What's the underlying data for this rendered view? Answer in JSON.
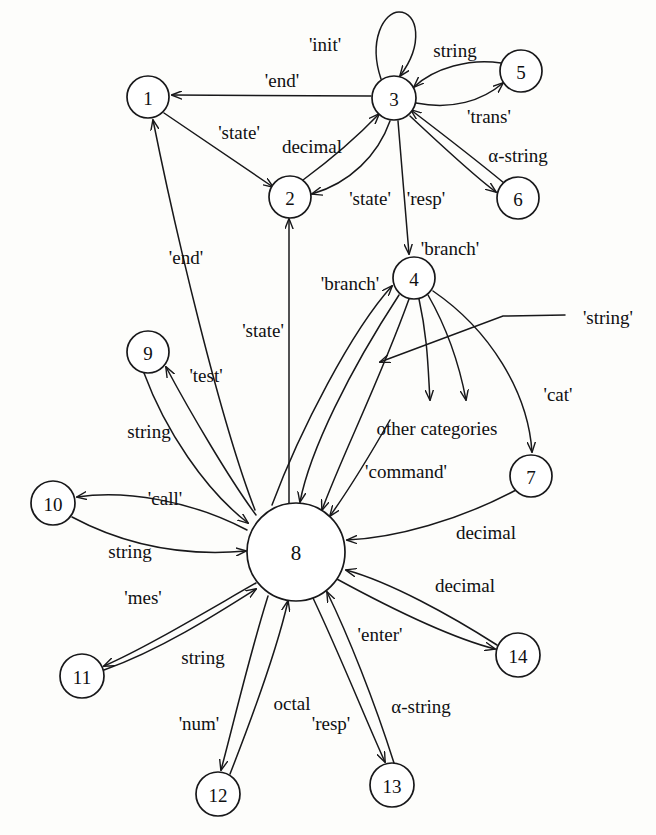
{
  "figure": {
    "type": "state-transition-diagram",
    "caption": "",
    "background_color": "#fdfdfb",
    "ink_color": "#18181a"
  },
  "nodes": [
    {
      "id": "1",
      "label": "1",
      "cx": 148,
      "cy": 97,
      "r": 21
    },
    {
      "id": "2",
      "label": "2",
      "cx": 290,
      "cy": 197,
      "r": 21
    },
    {
      "id": "3",
      "label": "3",
      "cx": 394,
      "cy": 98,
      "r": 22
    },
    {
      "id": "4",
      "label": "4",
      "cx": 414,
      "cy": 278,
      "r": 21
    },
    {
      "id": "5",
      "label": "5",
      "cx": 521,
      "cy": 71,
      "r": 21
    },
    {
      "id": "6",
      "label": "6",
      "cx": 518,
      "cy": 198,
      "r": 21
    },
    {
      "id": "7",
      "label": "7",
      "cx": 531,
      "cy": 476,
      "r": 21
    },
    {
      "id": "8",
      "label": "8",
      "cx": 296,
      "cy": 552,
      "r": 49
    },
    {
      "id": "9",
      "label": "9",
      "cx": 148,
      "cy": 352,
      "r": 21
    },
    {
      "id": "10",
      "label": "10",
      "cx": 53,
      "cy": 503,
      "r": 22
    },
    {
      "id": "11",
      "label": "11",
      "cx": 82,
      "cy": 676,
      "r": 22
    },
    {
      "id": "12",
      "label": "12",
      "cx": 218,
      "cy": 794,
      "r": 22
    },
    {
      "id": "13",
      "label": "13",
      "cx": 392,
      "cy": 785,
      "r": 22
    },
    {
      "id": "14",
      "label": "14",
      "cx": 518,
      "cy": 655,
      "r": 22
    }
  ],
  "edges": [
    {
      "id": "e-3-3",
      "from": "3",
      "to": "3",
      "label": "'init'",
      "label_x": 325,
      "label_y": 44,
      "path": "M 381 79 C 368 40 384 12 399 12 C 418 12 424 44 400 76"
    },
    {
      "id": "e-3-1",
      "from": "3",
      "to": "1",
      "label": "'end'",
      "label_x": 282,
      "label_y": 80,
      "path": "M 371 96 L 172 95"
    },
    {
      "id": "e-5-3",
      "from": "5",
      "to": "3",
      "label": "string",
      "label_x": 455,
      "label_y": 50,
      "path": "M 501 63 C 470 58 434 68 414 87"
    },
    {
      "id": "e-3-5",
      "from": "3",
      "to": "5",
      "label": "'trans'",
      "label_x": 489,
      "label_y": 116,
      "path": "M 416 103 C 452 110 482 101 503 83"
    },
    {
      "id": "e-1-2",
      "from": "1",
      "to": "2",
      "label": "'state'",
      "label_x": 239,
      "label_y": 132,
      "path": "M 164 113 L 273 187"
    },
    {
      "id": "e-2-3",
      "from": "2",
      "to": "3",
      "label": "decimal",
      "label_x": 312,
      "label_y": 146,
      "path": "M 303 180 C 330 160 358 136 379 114"
    },
    {
      "id": "e-3-2",
      "from": "3",
      "to": "2",
      "label": "'state'",
      "label_x": 370,
      "label_y": 198,
      "path": "M 390 121 C 378 155 350 183 312 194"
    },
    {
      "id": "e-6-3",
      "from": "6",
      "to": "3",
      "label": "α-string",
      "label_x": 518,
      "label_y": 155,
      "path": "M 504 183 C 470 155 432 126 411 110"
    },
    {
      "id": "e-3-6",
      "from": "3",
      "to": "6",
      "label": "'resp'",
      "label_x": 426,
      "label_y": 198,
      "path": "M 410 116 C 442 146 474 176 496 192"
    },
    {
      "id": "e-3-4",
      "from": "3",
      "to": "4",
      "label": "'branch'",
      "label_x": 450,
      "label_y": 248,
      "path": "M 398 121 C 402 170 406 215 409 254"
    },
    {
      "id": "e-8-4",
      "from": "8",
      "to": "4",
      "label": "'branch'",
      "label_x": 350,
      "label_y": 283,
      "path": "M 272 505 C 300 430 352 330 392 286"
    },
    {
      "id": "e-4-8a",
      "from": "4",
      "to": "8",
      "label": "",
      "label_x": 0,
      "label_y": 0,
      "path": "M 399 295 C 350 370 310 450 300 502"
    },
    {
      "id": "e-4-8b",
      "from": "4",
      "to": "8",
      "label": "",
      "label_x": 0,
      "label_y": 0,
      "path": "M 409 299 C 380 380 340 460 322 510"
    },
    {
      "id": "e-4-oc1",
      "from": "4",
      "to": "other-categories",
      "label": "",
      "label_x": 0,
      "label_y": 0,
      "path": "M 419 299 C 428 340 428 370 430 400"
    },
    {
      "id": "e-4-oc2",
      "from": "4",
      "to": "other-categories",
      "label": "",
      "label_x": 0,
      "label_y": 0,
      "path": "M 428 295 C 448 330 460 368 466 400"
    },
    {
      "id": "e-4-str",
      "from": "4",
      "to": "8",
      "label": "'string'",
      "label_x": 608,
      "label_y": 317,
      "path": "M 565 315 L 503 316 L 380 362"
    },
    {
      "id": "e-4-7",
      "from": "4",
      "to": "7",
      "label": "'cat'",
      "label_x": 558,
      "label_y": 394,
      "path": "M 433 291 C 490 330 528 392 532 452"
    },
    {
      "id": "e-1-8",
      "from": "8",
      "to": "1",
      "label": "'end'",
      "label_x": 186,
      "label_y": 257,
      "path": "M 255 510 C 220 420 175 230 153 120"
    },
    {
      "id": "e-8-2",
      "from": "8",
      "to": "2",
      "label": "'state'",
      "label_x": 263,
      "label_y": 330,
      "path": "M 289 503 C 289 420 289 300 289 219"
    },
    {
      "id": "e-8-9",
      "from": "8",
      "to": "9",
      "label": "'test'",
      "label_x": 206,
      "label_y": 375,
      "path": "M 256 515 C 230 480 190 412 166 367"
    },
    {
      "id": "e-9-8",
      "from": "9",
      "to": "8",
      "label": "string",
      "label_x": 149,
      "label_y": 431,
      "path": "M 144 373 C 165 430 205 490 248 523"
    },
    {
      "id": "e-8-10",
      "from": "8",
      "to": "10",
      "label": "'call'",
      "label_x": 165,
      "label_y": 498,
      "path": "M 247 530 C 190 500 125 490 77 497"
    },
    {
      "id": "e-10-8",
      "from": "10",
      "to": "8",
      "label": "string",
      "label_x": 130,
      "label_y": 551,
      "path": "M 72 517 C 130 548 190 556 246 551"
    },
    {
      "id": "e-8-11",
      "from": "8",
      "to": "11",
      "label": "'mes'",
      "label_x": 143,
      "label_y": 597,
      "path": "M 256 583 C 200 615 145 648 104 666"
    },
    {
      "id": "e-11-8",
      "from": "11",
      "to": "8",
      "label": "string",
      "label_x": 203,
      "label_y": 657,
      "path": "M 104 670 C 160 650 215 615 256 589"
    },
    {
      "id": "e-8-12",
      "from": "8",
      "to": "12",
      "label": "'num'",
      "label_x": 199,
      "label_y": 723,
      "path": "M 268 596 C 248 660 232 730 221 770"
    },
    {
      "id": "e-12-8",
      "from": "12",
      "to": "8",
      "label": "octal",
      "label_x": 292,
      "label_y": 703,
      "path": "M 230 774 C 255 710 278 645 288 601"
    },
    {
      "id": "e-8-13",
      "from": "8",
      "to": "13",
      "label": "'resp'",
      "label_x": 331,
      "label_y": 723,
      "path": "M 313 598 C 340 655 368 725 385 762"
    },
    {
      "id": "e-13-8",
      "from": "13",
      "to": "8",
      "label": "α-string",
      "label_x": 421,
      "label_y": 706,
      "path": "M 394 763 C 374 700 348 635 327 592"
    },
    {
      "id": "e-8-14",
      "from": "8",
      "to": "14",
      "label": "'enter'",
      "label_x": 380,
      "label_y": 634,
      "path": "M 335 578 C 390 608 452 638 495 649"
    },
    {
      "id": "e-14-8",
      "from": "14",
      "to": "8",
      "label": "decimal",
      "label_x": 465,
      "label_y": 585,
      "path": "M 497 645 C 450 615 390 582 346 570"
    },
    {
      "id": "e-7-8",
      "from": "7",
      "to": "8",
      "label": "decimal",
      "label_x": 486,
      "label_y": 532,
      "path": "M 516 490 C 460 520 395 538 347 540"
    },
    {
      "id": "e-8-cmd",
      "from": "8",
      "to": "8",
      "label": "'command'",
      "label_x": 406,
      "label_y": 471,
      "path": "M 390 420 C 370 455 345 495 330 516"
    }
  ],
  "free_text": [
    {
      "id": "other-categories-label",
      "text": "other categories",
      "x": 437,
      "y": 428
    }
  ]
}
